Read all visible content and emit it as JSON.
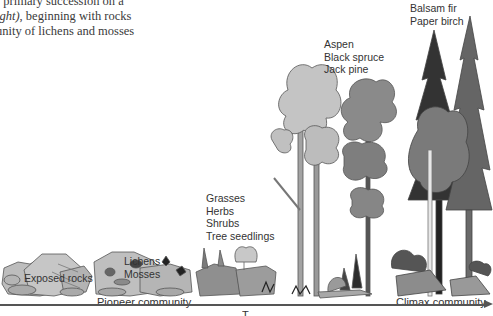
{
  "caption": {
    "line1": "f primary succession on a",
    "line2_italic": "ight)",
    "line2_rest": ", beginning with rocks",
    "line3": "unity of lichens and mosses"
  },
  "stages": [
    {
      "id": "exposed-rocks",
      "lines": [
        "Exposed rocks"
      ]
    },
    {
      "id": "lichens-mosses",
      "lines": [
        "Lichens",
        "Mosses"
      ]
    },
    {
      "id": "grasses-herbs",
      "lines": [
        "Grasses",
        "Herbs",
        "Shrubs",
        "Tree seedlings"
      ]
    },
    {
      "id": "aspen-spruce-pine",
      "lines": [
        "Aspen",
        "Black spruce",
        "Jack pine"
      ]
    },
    {
      "id": "balsam-birch",
      "lines": [
        "Balsam fir",
        "Paper birch"
      ]
    }
  ],
  "communities": {
    "pioneer": "Pioneer community",
    "climax": "Climax community"
  },
  "axis": {
    "label_partial": "T",
    "direction": "left-to-right arrow"
  },
  "colors": {
    "rock": "#b8b8b8",
    "rock_dark": "#8f8f8f",
    "light_foliage": "#c4c4c4",
    "mid_foliage": "#8a8a8a",
    "dark_conifer": "#3a3a3a",
    "mid_conifer": "#6a6a6a",
    "trunk": "#9a9a9a",
    "outline": "#555555"
  }
}
